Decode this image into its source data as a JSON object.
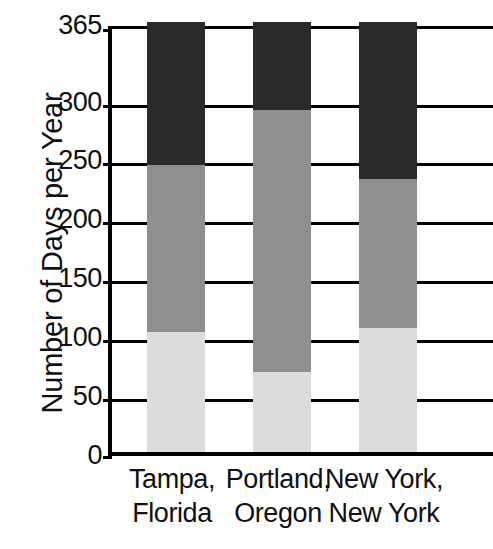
{
  "chart_data": {
    "type": "bar",
    "subtype": "stacked-bar",
    "title": "",
    "xlabel": "",
    "ylabel": "Number of Days per Year",
    "ylim": [
      0,
      365
    ],
    "yticks": [
      0,
      50,
      100,
      150,
      200,
      250,
      300,
      365
    ],
    "ytick_labels": [
      "0",
      "50",
      "100",
      "150",
      "200",
      "250",
      "300",
      "365"
    ],
    "grid": true,
    "legend": "none",
    "categories": [
      "Tampa, Florida",
      "Portland, Oregon",
      "New York, New York"
    ],
    "category_lines": [
      [
        "Tampa,",
        "Florida"
      ],
      [
        "Portland,",
        "Oregon"
      ],
      [
        "New York,",
        "New York"
      ]
    ],
    "series": [
      {
        "name": "light-gray-segment",
        "color": "#dcdcdc",
        "values": [
          102,
          68,
          105
        ]
      },
      {
        "name": "medium-gray-segment",
        "color": "#8f8f8f",
        "values": [
          142,
          222,
          127
        ]
      },
      {
        "name": "dark-segment",
        "color": "#2a2a2a",
        "values": [
          121,
          75,
          133
        ]
      }
    ],
    "cumulative_tops": [
      [
        102,
        244,
        365
      ],
      [
        68,
        290,
        365
      ],
      [
        105,
        232,
        365
      ]
    ]
  },
  "axis": {
    "y_title": "Number of Days per Year"
  },
  "colors": {
    "dark": "#2a2a2a",
    "medium": "#8f8f8f",
    "light": "#dcdcdc",
    "axis": "#000000",
    "background": "#ffffff"
  }
}
